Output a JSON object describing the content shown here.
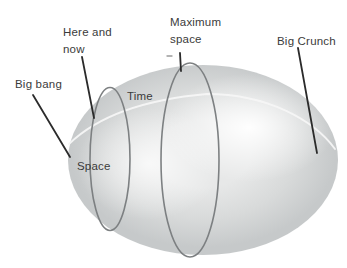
{
  "labels": {
    "big_bang": "Big bang",
    "here_and_now": {
      "line1": "Here and",
      "line2": "now"
    },
    "maximum_space": {
      "line1": "Maximum",
      "line2": "space"
    },
    "big_crunch": "Big Crunch",
    "time": "Time",
    "space": "Space"
  },
  "colors": {
    "background": "#ffffff",
    "ellipsoid_base": "#dcdddd",
    "ellipsoid_edge": "#c6c9ca",
    "ellipsoid_highlight": "#ffffff",
    "space_circle_stroke": "#7d8082",
    "pointer_line": "#2b2b2b",
    "time_line": "#f5f6f6",
    "text": "#3b3b3b"
  }
}
